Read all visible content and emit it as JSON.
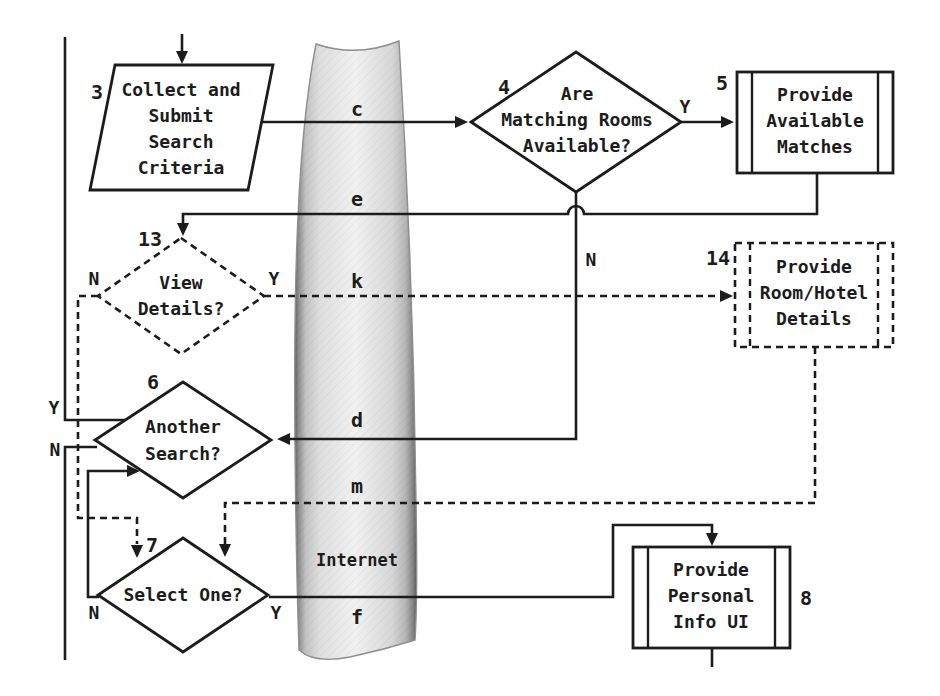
{
  "diagram": {
    "internet_label": "Internet",
    "connector_letters": {
      "c": "c",
      "e": "e",
      "k": "k",
      "d": "d",
      "m": "m",
      "f": "f"
    },
    "steps": {
      "collect_criteria": {
        "number": "3",
        "shape": "parallelogram",
        "lines": [
          "Collect and",
          "Submit",
          "Search",
          "Criteria"
        ]
      },
      "rooms_available": {
        "number": "4",
        "shape": "decision",
        "lines": [
          "Are",
          "Matching Rooms",
          "Available?"
        ],
        "yes_label": "Y",
        "no_label": "N"
      },
      "provide_matches": {
        "number": "5",
        "shape": "predefined-process",
        "lines": [
          "Provide",
          "Available",
          "Matches"
        ]
      },
      "view_details": {
        "number": "13",
        "shape": "decision-dashed",
        "lines": [
          "View",
          "Details?"
        ],
        "yes_label": "Y",
        "no_label": "N"
      },
      "room_hotel_details": {
        "number": "14",
        "shape": "predefined-process-dashed",
        "lines": [
          "Provide",
          "Room/Hotel",
          "Details"
        ]
      },
      "another_search": {
        "number": "6",
        "shape": "decision",
        "lines": [
          "Another",
          "Search?"
        ],
        "yes_label": "Y",
        "no_label": "N"
      },
      "select_one": {
        "number": "7",
        "shape": "decision",
        "lines": [
          "Select One?"
        ],
        "yes_label": "Y",
        "no_label": "N"
      },
      "personal_info": {
        "number": "8",
        "shape": "predefined-process",
        "lines": [
          "Provide",
          "Personal",
          "Info UI"
        ]
      }
    },
    "colors": {
      "line": "#1c1c1c",
      "background": "#ffffff",
      "band_edge": "#5e5e5e",
      "band_center": "#f1f1f1"
    }
  }
}
